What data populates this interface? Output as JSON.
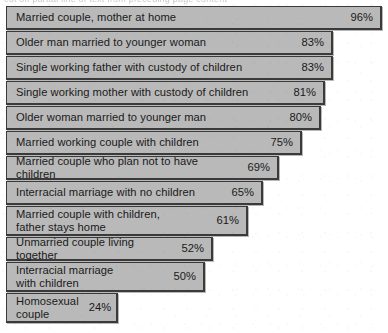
{
  "artifact": {
    "ghost_text": "cut off partial line of text from preceding page content"
  },
  "chart_data": {
    "type": "bar",
    "orientation": "horizontal",
    "title": "",
    "subtitle": "",
    "xlabel": "",
    "ylabel": "",
    "xlim": [
      0,
      100
    ],
    "grid": false,
    "legend": null,
    "value_suffix": "%",
    "categories": [
      "Married couple, mother at home",
      "Older man married to younger woman",
      "Single working father with custody of children",
      "Single working mother with custody of children",
      "Older woman married to younger man",
      "Married working couple with children",
      "Married couple who plan not to have children",
      "Interracial marriage with no children",
      "Married couple with children,\nfather stays home",
      "Unmarried couple living together",
      "Interracial marriage\nwith children",
      "Homosexual\ncouple"
    ],
    "values": [
      96,
      83,
      83,
      81,
      80,
      75,
      69,
      65,
      61,
      52,
      50,
      24
    ],
    "value_labels": [
      "96%",
      "83%",
      "83%",
      "81%",
      "80%",
      "75%",
      "69%",
      "65%",
      "61%",
      "52%",
      "50%",
      "24%"
    ],
    "colors": {
      "bar_fill": "#b9b9b9",
      "bar_border": "#3a3a3a",
      "text": "#1a1a1a",
      "background": "#ffffff"
    }
  },
  "rows": [
    {
      "label": "Married couple, mother at home",
      "value": "96%",
      "width_px": 376,
      "lines": 1
    },
    {
      "label": "Older man married to younger woman",
      "value": "83%",
      "width_px": 327,
      "lines": 1
    },
    {
      "label": "Single working father with custody of children",
      "value": "83%",
      "width_px": 327,
      "lines": 1
    },
    {
      "label": "Single working mother with custody of children",
      "value": "81%",
      "width_px": 319,
      "lines": 1
    },
    {
      "label": "Older woman married to younger man",
      "value": "80%",
      "width_px": 315,
      "lines": 1
    },
    {
      "label": "Married working couple with children",
      "value": "75%",
      "width_px": 296,
      "lines": 1
    },
    {
      "label": "Married couple who plan not to have children",
      "value": "69%",
      "width_px": 273,
      "lines": 1
    },
    {
      "label": "Interracial marriage with no children",
      "value": "65%",
      "width_px": 257,
      "lines": 1
    },
    {
      "label": "Married couple with children,\nfather stays home",
      "value": "61%",
      "width_px": 242,
      "lines": 2
    },
    {
      "label": "Unmarried couple living together",
      "value": "52%",
      "width_px": 207,
      "lines": 1
    },
    {
      "label": "Interracial marriage\nwith children",
      "value": "50%",
      "width_px": 199,
      "lines": 2
    },
    {
      "label": "Homosexual\ncouple",
      "value": "24%",
      "width_px": 112,
      "lines": 2
    }
  ]
}
